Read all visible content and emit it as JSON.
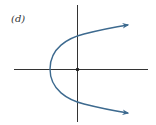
{
  "figure": {
    "label": "(d)",
    "colors": {
      "axes": "#333333",
      "curve": "#3d6a8f",
      "origin_dot": "#222222",
      "background": "#ffffff"
    },
    "axes": {
      "x_axis": "horizontal line through origin",
      "y_axis": "vertical line through origin"
    },
    "curve": {
      "type": "parabola",
      "orientation": "opens right",
      "vertex": "on negative x-axis",
      "arrows": [
        "upper-right",
        "lower-right"
      ]
    },
    "origin_marker": "dot"
  }
}
